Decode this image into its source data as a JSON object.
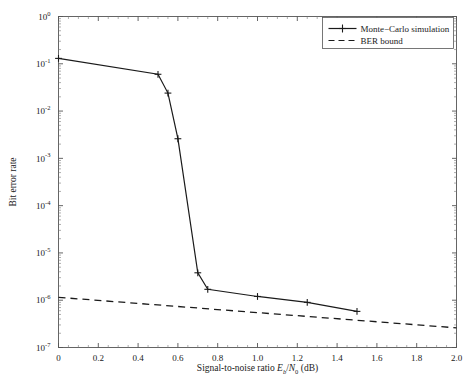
{
  "chart_data": {
    "type": "line",
    "title": "",
    "xlabel_parts": {
      "main": "Signal-to-noise ratio ",
      "e": "E",
      "e_sub": "b",
      "slash": "/",
      "n": "N",
      "n_sub": "0",
      "unit": " (dB)"
    },
    "xlabel": "Signal-to-noise ratio Eb/N0 (dB)",
    "ylabel": "Bit error rate",
    "xlim": [
      0,
      2.0
    ],
    "ylim": [
      1e-07,
      1
    ],
    "yscale": "log",
    "xscale": "linear",
    "xticks": [
      "0",
      "0.2",
      "0.4",
      "0.6",
      "0.8",
      "1.0",
      "1.2",
      "1.4",
      "1.6",
      "1.8",
      "2.0"
    ],
    "xtick_values": [
      0,
      0.2,
      0.4,
      0.6,
      0.8,
      1.0,
      1.2,
      1.4,
      1.6,
      1.8,
      2.0
    ],
    "ytick_exponents": [
      0,
      -1,
      -2,
      -3,
      -4,
      -5,
      -6,
      -7
    ],
    "ytick_base": "10",
    "grid": false,
    "legend_position": "upper right",
    "series": [
      {
        "name": "Monte−Carlo simulation",
        "style": "solid",
        "marker": "plus",
        "color": "#1a1a1a",
        "x": [
          0.0,
          0.5,
          0.55,
          0.6,
          0.7,
          0.75,
          1.0,
          1.25,
          1.5
        ],
        "y": [
          0.13,
          0.06,
          0.024,
          0.0026,
          3.8e-06,
          1.7e-06,
          1.2e-06,
          9e-07,
          5.8e-07
        ]
      },
      {
        "name": "BER bound",
        "style": "dashed",
        "marker": "none",
        "color": "#1a1a1a",
        "x": [
          0.0,
          2.0
        ],
        "y": [
          1.15e-06,
          2.6e-07
        ]
      }
    ]
  },
  "legend": {
    "items": [
      {
        "label": "Monte−Carlo simulation",
        "style": "solid-plus"
      },
      {
        "label": "BER bound",
        "style": "dashed"
      }
    ]
  }
}
